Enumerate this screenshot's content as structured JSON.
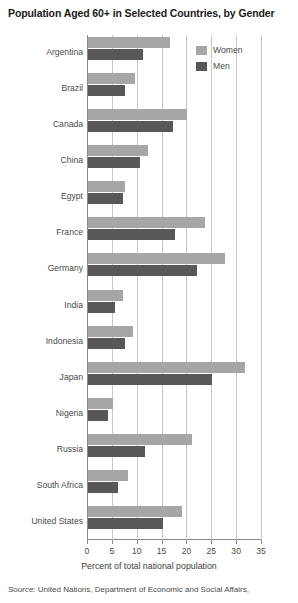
{
  "chart_data": {
    "type": "bar",
    "orientation": "horizontal",
    "title": "Population Aged 60+ in Selected Countries, by Gender",
    "xlabel": "Percent of total national population",
    "ylabel": "",
    "xlim": [
      0,
      35
    ],
    "xticks": [
      0,
      5,
      10,
      15,
      20,
      25,
      30,
      35
    ],
    "grid": true,
    "legend_position": "top-right",
    "categories": [
      "Argentina",
      "Brazil",
      "Canada",
      "China",
      "Egypt",
      "France",
      "Germany",
      "India",
      "Indonesia",
      "Japan",
      "Nigeria",
      "Russia",
      "South Africa",
      "United States"
    ],
    "series": [
      {
        "name": "Women",
        "color": "#a6a6a6",
        "values": [
          16.5,
          9.5,
          20.0,
          12.0,
          7.5,
          23.5,
          27.5,
          7.0,
          9.0,
          31.5,
          5.0,
          21.0,
          8.0,
          19.0
        ]
      },
      {
        "name": "Men",
        "color": "#585858",
        "values": [
          11.0,
          7.5,
          17.0,
          10.5,
          7.0,
          17.5,
          22.0,
          5.5,
          7.5,
          25.0,
          4.0,
          11.5,
          6.0,
          15.0
        ]
      }
    ]
  },
  "source": {
    "prefix": "Source:",
    "text": "United Nations, Department of Economic and Social Affairs,"
  }
}
